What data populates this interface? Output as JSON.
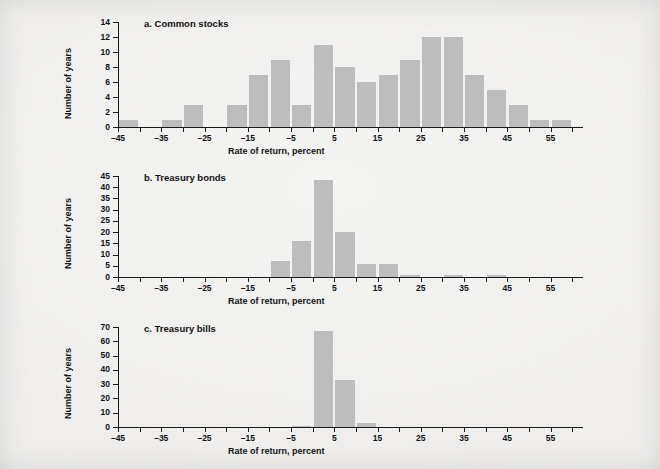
{
  "figure": {
    "background_color": "#efefee",
    "bar_color": "#bdbdbd",
    "axis_color": "#1a1a1a"
  },
  "axis_titles": {
    "x": "Rate of return, percent",
    "y": "Number of years"
  },
  "x_ticks": [
    "-45",
    "-35",
    "-25",
    "-15",
    "-5",
    "5",
    "15",
    "25",
    "35",
    "45",
    "55"
  ],
  "panels": [
    {
      "title": "a. Common stocks",
      "y_ticks": [
        "0",
        "2",
        "4",
        "6",
        "8",
        "10",
        "12",
        "14"
      ]
    },
    {
      "title": "b. Treasury bonds",
      "y_ticks": [
        "0",
        "5",
        "10",
        "15",
        "20",
        "25",
        "30",
        "35",
        "40",
        "45"
      ]
    },
    {
      "title": "c. Treasury bills",
      "y_ticks": [
        "0",
        "10",
        "20",
        "30",
        "40",
        "50",
        "60",
        "70"
      ]
    }
  ],
  "chart_data": [
    {
      "type": "bar",
      "title": "a. Common stocks",
      "xlabel": "Rate of return, percent",
      "ylabel": "Number of years",
      "xlim": [
        -45,
        62.5
      ],
      "ylim": [
        0,
        14
      ],
      "bin_width": 5,
      "grid": false,
      "legend": "none",
      "categories": [
        "-45 to -40",
        "-40 to -35",
        "-35 to -30",
        "-30 to -25",
        "-25 to -20",
        "-20 to -15",
        "-15 to -10",
        "-10 to -5",
        "-5 to 0",
        "0 to 5",
        "5 to 10",
        "10 to 15",
        "15 to 20",
        "20 to 25",
        "25 to 30",
        "30 to 35",
        "35 to 40",
        "40 to 45",
        "45 to 50",
        "50 to 55",
        "55 to 60"
      ],
      "bin_starts": [
        -45,
        -40,
        -35,
        -30,
        -25,
        -20,
        -15,
        -10,
        -5,
        0,
        5,
        10,
        15,
        20,
        25,
        30,
        35,
        40,
        45,
        50,
        55
      ],
      "values": [
        1,
        0,
        1,
        3,
        0,
        3,
        7,
        9,
        3,
        11,
        8,
        6,
        7,
        9,
        12,
        12,
        7,
        5,
        3,
        1,
        1
      ]
    },
    {
      "type": "bar",
      "title": "b. Treasury bonds",
      "xlabel": "Rate of return, percent",
      "ylabel": "Number of years",
      "xlim": [
        -45,
        62.5
      ],
      "ylim": [
        0,
        45
      ],
      "bin_width": 5,
      "grid": false,
      "legend": "none",
      "categories": [
        "-45 to -40",
        "-40 to -35",
        "-35 to -30",
        "-30 to -25",
        "-25 to -20",
        "-20 to -15",
        "-15 to -10",
        "-10 to -5",
        "-5 to 0",
        "0 to 5",
        "5 to 10",
        "10 to 15",
        "15 to 20",
        "20 to 25",
        "25 to 30",
        "30 to 35",
        "35 to 40",
        "40 to 45",
        "45 to 50",
        "50 to 55",
        "55 to 60"
      ],
      "bin_starts": [
        -45,
        -40,
        -35,
        -30,
        -25,
        -20,
        -15,
        -10,
        -5,
        0,
        5,
        10,
        15,
        20,
        25,
        30,
        35,
        40,
        45,
        50,
        55
      ],
      "values": [
        0,
        0,
        0,
        0,
        0,
        0,
        0,
        7,
        16,
        43,
        20,
        6,
        6,
        1,
        0,
        1,
        0,
        1,
        0,
        0,
        0
      ]
    },
    {
      "type": "bar",
      "title": "c. Treasury bills",
      "xlabel": "Rate of return, percent",
      "ylabel": "Number of years",
      "xlim": [
        -45,
        62.5
      ],
      "ylim": [
        0,
        70
      ],
      "bin_width": 5,
      "grid": false,
      "legend": "none",
      "categories": [
        "-45 to -40",
        "-40 to -35",
        "-35 to -30",
        "-30 to -25",
        "-25 to -20",
        "-20 to -15",
        "-15 to -10",
        "-10 to -5",
        "-5 to 0",
        "0 to 5",
        "5 to 10",
        "10 to 15",
        "15 to 20",
        "20 to 25",
        "25 to 30",
        "30 to 35",
        "35 to 40",
        "40 to 45",
        "45 to 50",
        "50 to 55",
        "55 to 60"
      ],
      "bin_starts": [
        -45,
        -40,
        -35,
        -30,
        -25,
        -20,
        -15,
        -10,
        -5,
        0,
        5,
        10,
        15,
        20,
        25,
        30,
        35,
        40,
        45,
        50,
        55
      ],
      "values": [
        0,
        0,
        0,
        0,
        0,
        0,
        0,
        0,
        1,
        67,
        33,
        3,
        0,
        0,
        0,
        0,
        0,
        0,
        0,
        0,
        0
      ]
    }
  ]
}
